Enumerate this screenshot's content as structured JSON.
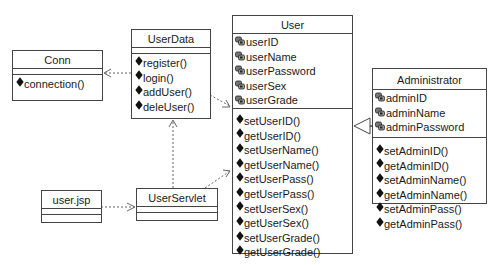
{
  "diagram_type": "UML class diagram",
  "classes": {
    "conn": {
      "name": "Conn",
      "attributes": [],
      "operations": [
        "connection()"
      ]
    },
    "userdata": {
      "name": "UserData",
      "attributes": [],
      "operations": [
        "register()",
        "login()",
        "addUser()",
        "deleUser()"
      ]
    },
    "user": {
      "name": "User",
      "attributes": [
        "userID",
        "userName",
        "userPassword",
        "userSex",
        "userGrade"
      ],
      "operations": [
        "setUserID()",
        "getUserID()",
        "setUserName()",
        "getUserName()",
        "setUserPass()",
        "getUserPass()",
        "setUserSex()",
        "getUserSex()",
        "setUserGrade()",
        "getUserGrade()"
      ]
    },
    "administrator": {
      "name": "Administrator",
      "attributes": [
        "adminID",
        "adminName",
        "adminPassword"
      ],
      "operations": [
        "setAdminID()",
        "getAdminID()",
        "setAdminName()",
        "getAdminName()",
        "setAdminPass()",
        "getAdminPass()"
      ]
    },
    "userjsp": {
      "name": "user.jsp",
      "attributes": [],
      "operations": []
    },
    "userservlet": {
      "name": "UserServlet",
      "attributes": [],
      "operations": []
    }
  },
  "relationships": [
    {
      "type": "dependency",
      "from": "UserData",
      "to": "Conn"
    },
    {
      "type": "dependency",
      "from": "UserData",
      "to": "User"
    },
    {
      "type": "dependency",
      "from": "user.jsp",
      "to": "UserServlet"
    },
    {
      "type": "dependency",
      "from": "UserServlet",
      "to": "UserData"
    },
    {
      "type": "dependency",
      "from": "UserServlet",
      "to": "User"
    },
    {
      "type": "generalization",
      "from": "Administrator",
      "to": "User"
    }
  ],
  "icons": {
    "attribute": "private-attribute-icon",
    "operation": "public-operation-icon"
  },
  "colors": {
    "line": "#444444",
    "dashed": "#666666",
    "background": "#ffffff"
  }
}
